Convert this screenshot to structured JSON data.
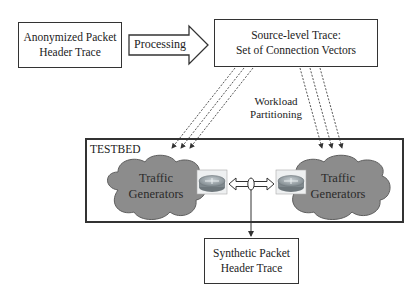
{
  "diagram": {
    "nodes": {
      "input_trace": {
        "line1": "Anonymized Packet",
        "line2": "Header Trace"
      },
      "processing_arrow": {
        "label": "Processing"
      },
      "source_trace": {
        "line1": "Source-level Trace:",
        "line2": "Set of Connection Vectors"
      },
      "partitioning": {
        "line1": "Workload",
        "line2": "Partitioning"
      },
      "testbed": {
        "label": "TESTBED"
      },
      "left_generators": {
        "line1": "Traffic",
        "line2": "Generators"
      },
      "right_generators": {
        "line1": "Traffic",
        "line2": "Generators"
      },
      "output_trace": {
        "line1": "Synthetic Packet",
        "line2": "Header Trace"
      }
    },
    "edges": [
      {
        "from": "input_trace",
        "to": "source_trace",
        "label": "Processing",
        "style": "block-arrow"
      },
      {
        "from": "source_trace",
        "to": "left_generators",
        "style": "dashed",
        "count": 3
      },
      {
        "from": "source_trace",
        "to": "right_generators",
        "style": "dashed",
        "count": 3
      },
      {
        "from": "left_router",
        "to": "right_router",
        "style": "double-arrow"
      },
      {
        "from": "link_tap",
        "to": "output_trace",
        "style": "solid-arrow"
      }
    ],
    "colors": {
      "cloud": "#8a8a8a",
      "cloud_edge": "#5a5a5a",
      "router": "#9aa3a8",
      "border": "#333333"
    }
  }
}
